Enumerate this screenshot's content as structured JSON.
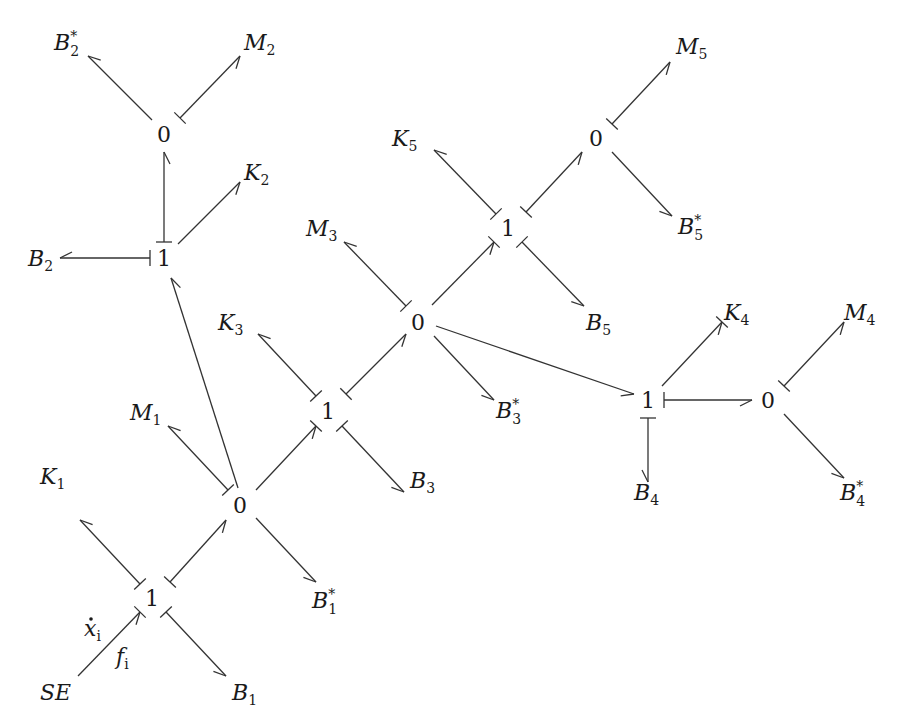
{
  "diagram": {
    "type": "bond-graph",
    "colors": {
      "line": "#333333",
      "text": "#1a1a1a",
      "background": "#ffffff"
    },
    "junctions": [
      {
        "id": "j1a",
        "label": "1",
        "x": 152,
        "y": 598
      },
      {
        "id": "j0a",
        "label": "0",
        "x": 240,
        "y": 505
      },
      {
        "id": "j1b",
        "label": "1",
        "x": 328,
        "y": 411
      },
      {
        "id": "j0b",
        "label": "0",
        "x": 418,
        "y": 322
      },
      {
        "id": "j1c",
        "label": "1",
        "x": 508,
        "y": 228
      },
      {
        "id": "j0c",
        "label": "0",
        "x": 596,
        "y": 138
      },
      {
        "id": "j1d",
        "label": "1",
        "x": 164,
        "y": 258
      },
      {
        "id": "j0d",
        "label": "0",
        "x": 164,
        "y": 134
      },
      {
        "id": "j1e",
        "label": "1",
        "x": 648,
        "y": 400
      },
      {
        "id": "j0e",
        "label": "0",
        "x": 768,
        "y": 400
      }
    ],
    "elements": [
      {
        "id": "SE",
        "main": "SE",
        "sub": "",
        "sup": "",
        "x": 40,
        "y": 700
      },
      {
        "id": "K1",
        "main": "K",
        "sub": "1",
        "sup": "",
        "x": 40,
        "y": 484
      },
      {
        "id": "M1",
        "main": "M",
        "sub": "1",
        "sup": "",
        "x": 130,
        "y": 420
      },
      {
        "id": "B1",
        "main": "B",
        "sub": "1",
        "sup": "",
        "x": 232,
        "y": 700
      },
      {
        "id": "B1s",
        "main": "B",
        "sub": "1",
        "sup": "*",
        "x": 312,
        "y": 608
      },
      {
        "id": "K3",
        "main": "K",
        "sub": "3",
        "sup": "",
        "x": 218,
        "y": 330
      },
      {
        "id": "B3",
        "main": "B",
        "sub": "3",
        "sup": "",
        "x": 410,
        "y": 488
      },
      {
        "id": "M3",
        "main": "M",
        "sub": "3",
        "sup": "",
        "x": 306,
        "y": 236
      },
      {
        "id": "B3s",
        "main": "B",
        "sub": "3",
        "sup": "*",
        "x": 496,
        "y": 418
      },
      {
        "id": "K5",
        "main": "K",
        "sub": "5",
        "sup": "",
        "x": 392,
        "y": 146
      },
      {
        "id": "B5",
        "main": "B",
        "sub": "5",
        "sup": "",
        "x": 586,
        "y": 330
      },
      {
        "id": "M5",
        "main": "M",
        "sub": "5",
        "sup": "",
        "x": 676,
        "y": 54
      },
      {
        "id": "B5s",
        "main": "B",
        "sub": "5",
        "sup": "*",
        "x": 678,
        "y": 234
      },
      {
        "id": "B2",
        "main": "B",
        "sub": "2",
        "sup": "",
        "x": 28,
        "y": 266
      },
      {
        "id": "K2",
        "main": "K",
        "sub": "2",
        "sup": "",
        "x": 244,
        "y": 180
      },
      {
        "id": "B2s",
        "main": "B",
        "sub": "2",
        "sup": "*",
        "x": 54,
        "y": 50
      },
      {
        "id": "M2",
        "main": "M",
        "sub": "2",
        "sup": "",
        "x": 244,
        "y": 50
      },
      {
        "id": "K4",
        "main": "K",
        "sub": "4",
        "sup": "",
        "x": 724,
        "y": 320
      },
      {
        "id": "B4",
        "main": "B",
        "sub": "4",
        "sup": "",
        "x": 634,
        "y": 500
      },
      {
        "id": "M4",
        "main": "M",
        "sub": "4",
        "sup": "",
        "x": 844,
        "y": 320
      },
      {
        "id": "B4s",
        "main": "B",
        "sub": "4",
        "sup": "*",
        "x": 840,
        "y": 500
      }
    ],
    "annotations": [
      {
        "id": "xdot",
        "main": "x",
        "sub": "i",
        "dot": true,
        "x": 84,
        "y": 636
      },
      {
        "id": "fi",
        "main": "f",
        "sub": "i",
        "dot": false,
        "x": 116,
        "y": 664
      }
    ],
    "bonds": [
      {
        "from": [
          78,
          676
        ],
        "to": [
          140,
          612
        ],
        "head": "end",
        "stroke": "end"
      },
      {
        "from": [
          140,
          584
        ],
        "to": [
          80,
          520
        ],
        "head": "end",
        "stroke": "start"
      },
      {
        "from": [
          166,
          612
        ],
        "to": [
          226,
          676
        ],
        "head": "end",
        "stroke": "start"
      },
      {
        "from": [
          170,
          582
        ],
        "to": [
          226,
          520
        ],
        "head": "end",
        "stroke": "start"
      },
      {
        "from": [
          228,
          490
        ],
        "to": [
          168,
          426
        ],
        "head": "end",
        "stroke": "start"
      },
      {
        "from": [
          256,
          518
        ],
        "to": [
          316,
          582
        ],
        "head": "end",
        "stroke": "none"
      },
      {
        "from": [
          238,
          488
        ],
        "to": [
          171,
          278
        ],
        "head": "end",
        "stroke": "none"
      },
      {
        "from": [
          256,
          490
        ],
        "to": [
          316,
          426
        ],
        "head": "end",
        "stroke": "end"
      },
      {
        "from": [
          316,
          396
        ],
        "to": [
          258,
          334
        ],
        "head": "end",
        "stroke": "start"
      },
      {
        "from": [
          342,
          426
        ],
        "to": [
          404,
          492
        ],
        "head": "end",
        "stroke": "start"
      },
      {
        "from": [
          346,
          394
        ],
        "to": [
          406,
          334
        ],
        "head": "end",
        "stroke": "start"
      },
      {
        "from": [
          406,
          306
        ],
        "to": [
          344,
          242
        ],
        "head": "end",
        "stroke": "start"
      },
      {
        "from": [
          434,
          336
        ],
        "to": [
          494,
          400
        ],
        "head": "end",
        "stroke": "none"
      },
      {
        "from": [
          436,
          326
        ],
        "to": [
          634,
          394
        ],
        "head": "end",
        "stroke": "none"
      },
      {
        "from": [
          432,
          305
        ],
        "to": [
          494,
          242
        ],
        "head": "end",
        "stroke": "end"
      },
      {
        "from": [
          496,
          214
        ],
        "to": [
          434,
          150
        ],
        "head": "end",
        "stroke": "start"
      },
      {
        "from": [
          522,
          242
        ],
        "to": [
          584,
          306
        ],
        "head": "end",
        "stroke": "start"
      },
      {
        "from": [
          526,
          212
        ],
        "to": [
          582,
          152
        ],
        "head": "end",
        "stroke": "start"
      },
      {
        "from": [
          612,
          124
        ],
        "to": [
          670,
          62
        ],
        "head": "end",
        "stroke": "start"
      },
      {
        "from": [
          612,
          152
        ],
        "to": [
          672,
          216
        ],
        "head": "end",
        "stroke": "none"
      },
      {
        "from": [
          150,
          258
        ],
        "to": [
          60,
          258
        ],
        "head": "end",
        "stroke": "start"
      },
      {
        "from": [
          178,
          244
        ],
        "to": [
          240,
          182
        ],
        "head": "end",
        "stroke": "none"
      },
      {
        "from": [
          164,
          242
        ],
        "to": [
          164,
          152
        ],
        "head": "end",
        "stroke": "start"
      },
      {
        "from": [
          152,
          120
        ],
        "to": [
          88,
          56
        ],
        "head": "end",
        "stroke": "none"
      },
      {
        "from": [
          180,
          118
        ],
        "to": [
          240,
          56
        ],
        "head": "end",
        "stroke": "start"
      },
      {
        "from": [
          662,
          386
        ],
        "to": [
          722,
          322
        ],
        "head": "end",
        "stroke": "end"
      },
      {
        "from": [
          648,
          418
        ],
        "to": [
          648,
          482
        ],
        "head": "end",
        "stroke": "start"
      },
      {
        "from": [
          664,
          400
        ],
        "to": [
          752,
          400
        ],
        "head": "end",
        "stroke": "start"
      },
      {
        "from": [
          784,
          386
        ],
        "to": [
          844,
          322
        ],
        "head": "end",
        "stroke": "start"
      },
      {
        "from": [
          784,
          414
        ],
        "to": [
          844,
          478
        ],
        "head": "end",
        "stroke": "none"
      }
    ]
  }
}
